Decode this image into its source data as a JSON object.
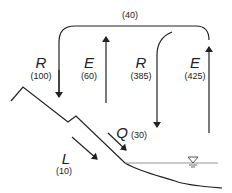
{
  "diagram": {
    "loop_label": "(40)",
    "fluxes": [
      {
        "symbol": "R",
        "value": "(100)",
        "direction": "down",
        "meaning": "precipitation over land"
      },
      {
        "symbol": "E",
        "value": "(60)",
        "direction": "up",
        "meaning": "evaporation from land"
      },
      {
        "symbol": "R",
        "value": "(385)",
        "direction": "down",
        "meaning": "precipitation over ocean"
      },
      {
        "symbol": "E",
        "value": "(425)",
        "direction": "up",
        "meaning": "evaporation from ocean"
      },
      {
        "symbol": "Q",
        "value": "(30)",
        "direction": "down-right",
        "meaning": "surface runoff"
      },
      {
        "symbol": "L",
        "value": "(10)",
        "direction": "down-right",
        "meaning": "groundwater flow"
      }
    ],
    "water_level_symbol": "water-surface-icon",
    "colors": {
      "line": "#222222",
      "water_line": "#888888"
    }
  }
}
